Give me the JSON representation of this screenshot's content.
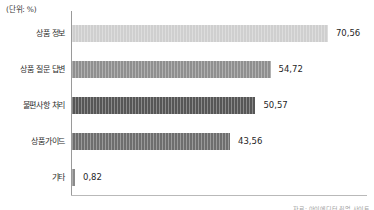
{
  "unit_note": "(단위: %)",
  "source_note": "자료: 아이에디터 취업 사이트",
  "axis": {
    "value_max": 75.0
  },
  "chart_data": {
    "type": "bar",
    "orientation": "horizontal",
    "title": "",
    "subtitle": "",
    "xlabel": "",
    "ylabel": "",
    "unit": "%",
    "grid": false,
    "legend": "none",
    "xlim": [
      0,
      75
    ],
    "categories": [
      "상품 정보",
      "상품 질문 답변",
      "불편사항 처리",
      "상품가이드",
      "기타"
    ],
    "values": [
      70.56,
      54.72,
      50.57,
      43.56,
      0.82
    ],
    "value_labels": [
      "70,56",
      "54,72",
      "50,57",
      "43,56",
      "0,82"
    ],
    "colors": [
      "#cfcfcf",
      "#8f8f8f",
      "#565656",
      "#6e6e6e",
      "#8a8a8a"
    ]
  }
}
